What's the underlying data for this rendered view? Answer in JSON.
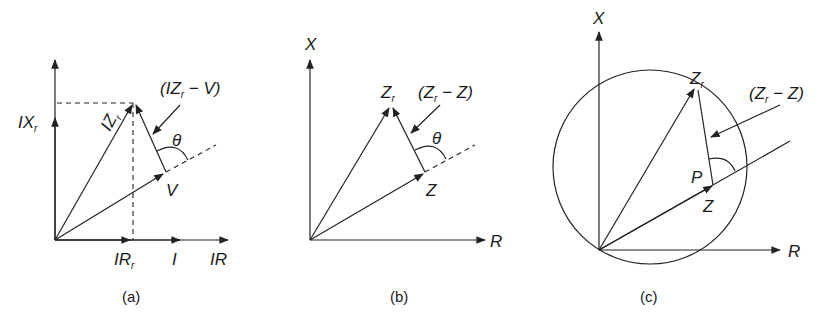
{
  "figure": {
    "panels": [
      {
        "id": "a",
        "caption": "(a)",
        "labels": {
          "y_axis_component": "IX",
          "y_axis_component_sub": "r",
          "vector_izr": "IZ",
          "vector_izr_sub": "r",
          "difference_vector": "(IZ",
          "difference_vector_sub": "r",
          "difference_vector_tail": " − V)",
          "angle": "θ",
          "vector_v": "V",
          "x_axis_component": "IR",
          "x_axis_component_sub": "r",
          "current": "I",
          "x_axis": "IR"
        }
      },
      {
        "id": "b",
        "caption": "(b)",
        "labels": {
          "y_axis": "X",
          "vector_zr": "Z",
          "vector_zr_sub": "r",
          "difference_vector": "(Z",
          "difference_vector_sub": "r",
          "difference_vector_tail": " − Z)",
          "angle": "θ",
          "vector_z": "Z",
          "x_axis": "R"
        }
      },
      {
        "id": "c",
        "caption": "(c)",
        "labels": {
          "y_axis": "X",
          "vector_zr": "Z",
          "vector_zr_sub": "r",
          "difference_vector": "(Z",
          "difference_vector_sub": "r",
          "difference_vector_tail": " − Z)",
          "point": "P",
          "vector_z": "Z",
          "x_axis": "R"
        }
      }
    ]
  }
}
